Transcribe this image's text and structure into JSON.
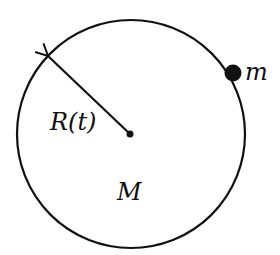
{
  "diagram": {
    "type": "physics-figure",
    "colors": {
      "stroke": "#111111",
      "fill": "#111111",
      "background": "#ffffff"
    },
    "circle": {
      "cx": 131,
      "cy": 134,
      "r": 114
    },
    "center_point": {
      "cx": 130,
      "cy": 134,
      "r": 3
    },
    "radius_arrow": {
      "from": [
        130,
        134
      ],
      "to": [
        47,
        55
      ]
    },
    "particle": {
      "cx": 233,
      "cy": 73,
      "r": 8
    },
    "labels": {
      "radius": "R(t)",
      "central_mass": "M",
      "particle_mass": "m"
    }
  }
}
